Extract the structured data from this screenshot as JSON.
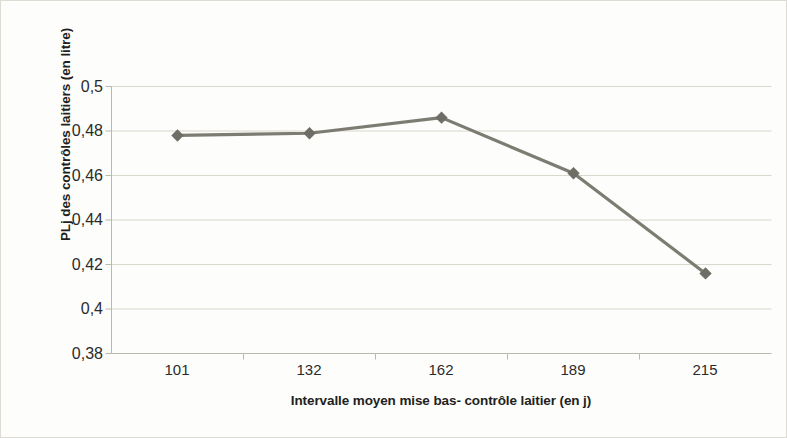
{
  "chart_data": {
    "type": "line",
    "title": "",
    "subtitle": "",
    "xlabel": "Intervalle moyen mise bas- contrôle laitier (en j)",
    "ylabel": "PLj  des contrôles laitiers (en litre)",
    "categories": [
      "101",
      "132",
      "162",
      "189",
      "215"
    ],
    "x": [
      101,
      132,
      162,
      189,
      215
    ],
    "values": [
      0.478,
      0.479,
      0.486,
      0.461,
      0.416
    ],
    "series": [
      {
        "name": "PLj des contrôles laitiers",
        "values": [
          0.478,
          0.479,
          0.486,
          0.461,
          0.416
        ]
      }
    ],
    "ylim": [
      0.38,
      0.5
    ],
    "yticks": [
      0.38,
      0.4,
      0.42,
      0.44,
      0.46,
      0.48,
      0.5
    ],
    "ytick_labels": [
      "0,38",
      "0,4",
      "0,42",
      "0,44",
      "0,46",
      "0,48",
      "0,5"
    ],
    "xtick_labels": [
      "101",
      "132",
      "162",
      "189",
      "215"
    ],
    "grid": "horizontal",
    "legend": "none",
    "marker": "diamond",
    "line_color": "#7c7c72",
    "marker_color": "#6e6e66",
    "grid_color": "#d8d8cc",
    "axis_color": "#b9b9ae",
    "plot_background": "#ffffff",
    "figure_background": "#fdfdfb",
    "text_color": "#231f20"
  }
}
